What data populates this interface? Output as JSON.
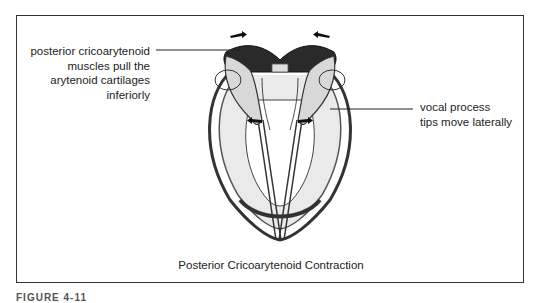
{
  "figure": {
    "caption": "Posterior Cricoarytenoid Contraction",
    "figure_label": "FIGURE 4-11",
    "annotations": {
      "left": [
        "posterior cricoarytenoid",
        "muscles pull the",
        "arytenoid cartilages",
        "inferiorly"
      ],
      "right": [
        "vocal process",
        "tips move laterally"
      ]
    },
    "illustration": "posterior view of larynx showing arytenoid cartilages rotating with vocal process tips moving laterally",
    "colors": {
      "ink": "#222222",
      "frame": "#333333",
      "muscle_fill": "#2a2a2a",
      "cartilage_fill": "#d8d8d8"
    }
  }
}
